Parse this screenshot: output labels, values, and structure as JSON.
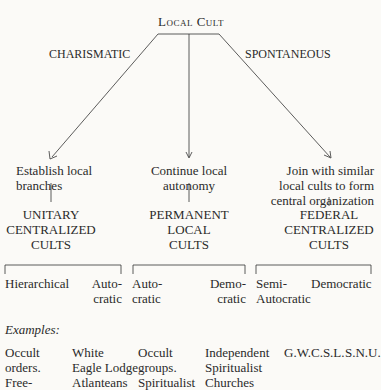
{
  "root": {
    "label": "Local Cult"
  },
  "branches": [
    {
      "path_label": "CHARISMATIC",
      "action": [
        "Establish local",
        "branches"
      ],
      "result": [
        "UNITARY",
        "CENTRALIZED",
        "CULTS"
      ],
      "subtypes": [
        [
          "Hierarchical"
        ],
        [
          "Auto-",
          "cratic"
        ]
      ]
    },
    {
      "path_label": "",
      "action": [
        "Continue local",
        "autonomy"
      ],
      "result": [
        "PERMANENT",
        "LOCAL",
        "CULTS"
      ],
      "subtypes": [
        [
          "Auto-",
          "cratic"
        ],
        [
          "Demo-",
          "cratic"
        ]
      ]
    },
    {
      "path_label": "SPONTANEOUS",
      "action": [
        "Join with similar",
        "local cults to form",
        "central organization"
      ],
      "result": [
        "FEDERAL",
        "CENTRALIZED",
        "CULTS"
      ],
      "subtypes": [
        [
          "Semi-",
          "Autocratic"
        ],
        [
          "Democratic"
        ]
      ]
    }
  ],
  "examples": {
    "heading": "Examples:",
    "columns": [
      [
        "Occult",
        "orders.",
        "Free-"
      ],
      [
        "White",
        "Eagle Lodge",
        "Atlanteans"
      ],
      [
        "Occult",
        "groups.",
        "Spiritualist"
      ],
      [
        "Independent",
        "Spiritualist",
        "Churches"
      ],
      [
        "G.W.C.S.L."
      ],
      [
        "S.N.U."
      ]
    ]
  }
}
